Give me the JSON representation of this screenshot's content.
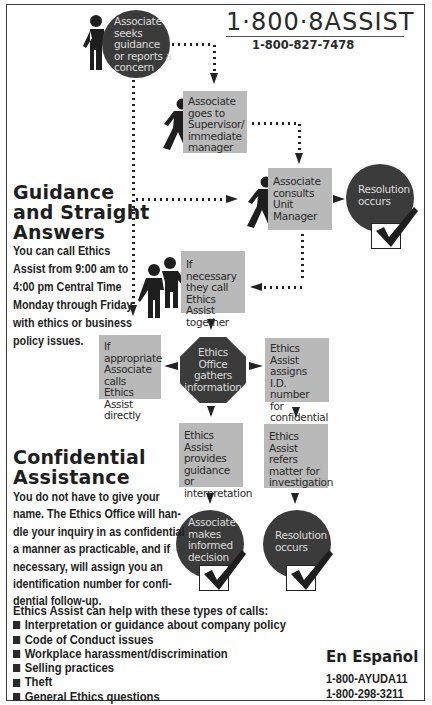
{
  "header": {
    "main_number": "1·800·8ASSIST",
    "numeric_number": "1-800-827-7478"
  },
  "flow": {
    "start": {
      "text": "Associate seeks guidance or reports a concern",
      "shape": "circle",
      "icon": "person-standing-icon"
    },
    "supervisor": {
      "text": "Associate goes to Supervisor/ immediate manager",
      "shape": "box",
      "icon": "person-walking-icon"
    },
    "unit_manager": {
      "text": "Associate consults Unit Manager",
      "shape": "box",
      "icon": "person-walking-icon"
    },
    "resolution_top": {
      "text": "Resolution occurs",
      "shape": "circle",
      "icon": "checkmark-icon"
    },
    "call_together": {
      "text": "If necessary they call Ethics Assist together",
      "shape": "box",
      "icon": "two-people-icon"
    },
    "call_directly": {
      "text": "If appropriate Associate calls Ethics Assist directly",
      "shape": "box"
    },
    "ethics_office": {
      "text": "Ethics Office gathers information",
      "shape": "octagon"
    },
    "assign_id": {
      "text": "Ethics Assist assigns I.D. number for confidential follow-up",
      "shape": "box"
    },
    "provides_guidance": {
      "text": "Ethics Assist provides guidance or interpretation",
      "shape": "box"
    },
    "refers_matter": {
      "text": "Ethics Assist refers matter for investigation",
      "shape": "box"
    },
    "informed_decision": {
      "text": "Associate makes informed decision",
      "shape": "circle",
      "icon": "checkmark-icon"
    },
    "resolution_bottom": {
      "text": "Resolution occurs",
      "shape": "circle",
      "icon": "checkmark-icon"
    }
  },
  "guidance": {
    "heading_line1": "Guidance",
    "heading_line2": "and Straight",
    "heading_line3": "Answers",
    "body": [
      "You can call Ethics",
      "Assist from 9:00 am to",
      "4:00 pm Central Time",
      "Monday through Friday",
      "with ethics or business",
      "policy issues."
    ]
  },
  "confidential": {
    "heading_line1": "Confidential",
    "heading_line2": "Assistance",
    "body": [
      "You do not have to give your",
      "name. The Ethics Office will han-",
      "dle your inquiry in as confidential",
      "a manner as practicable, and if",
      "necessary, will assign you an",
      "identification number for confi-",
      "dential follow-up."
    ]
  },
  "help_types": {
    "intro": "Ethics Assist can help with these types of calls:",
    "items": [
      "Interpretation or guidance about company policy",
      "Code of Conduct issues",
      "Workplace harassment/discrimination",
      "Selling practices",
      "Theft",
      "General Ethics questions"
    ]
  },
  "espanol": {
    "heading": "En Español",
    "number1": "1-800-AYUDA11",
    "number2": "1-800-298-3211"
  },
  "colors": {
    "box_fill": "#b9b9b9",
    "circle_fill": "#3b3b3b",
    "text_dark": "#1e1e1e"
  }
}
